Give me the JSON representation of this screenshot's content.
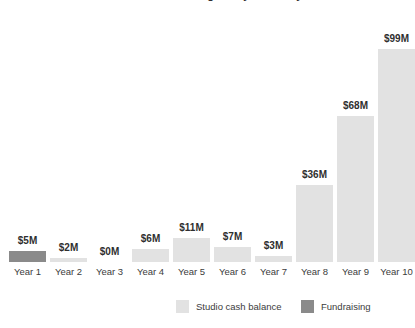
{
  "chart_data": {
    "type": "bar",
    "title": "Studio cash balance grows year over year",
    "title_clipped": true,
    "xlabel": "",
    "ylabel": "",
    "ylim": [
      0,
      108
    ],
    "grid": false,
    "legend_position": "bottom",
    "categories": [
      "Year 1",
      "Year 2",
      "Year 3",
      "Year 4",
      "Year 5",
      "Year 6",
      "Year 7",
      "Year 8",
      "Year 9",
      "Year 10"
    ],
    "values": [
      5,
      2,
      0,
      6,
      11,
      7,
      3,
      36,
      68,
      99
    ],
    "value_labels": [
      "$5M",
      "$2M",
      "$0M",
      "$6M",
      "$11M",
      "$7M",
      "$3M",
      "$36M",
      "$68M",
      "$99M"
    ],
    "bar_series": [
      "Fundraising",
      "Studio cash balance",
      "Studio cash balance",
      "Studio cash balance",
      "Studio cash balance",
      "Studio cash balance",
      "Studio cash balance",
      "Studio cash balance",
      "Studio cash balance",
      "Studio cash balance"
    ],
    "series": [
      {
        "name": "Studio cash balance",
        "color": "#e2e2e2",
        "values": [
          null,
          2,
          0,
          6,
          11,
          7,
          3,
          36,
          68,
          99
        ]
      },
      {
        "name": "Fundraising",
        "color": "#8a8a8a",
        "values": [
          5,
          null,
          null,
          null,
          null,
          null,
          null,
          null,
          null,
          null
        ]
      }
    ]
  },
  "legend": {
    "items": [
      {
        "label": "Studio cash balance",
        "color": "#e2e2e2"
      },
      {
        "label": "Fundraising",
        "color": "#8a8a8a"
      }
    ]
  },
  "colors": {
    "background": "#ffffff",
    "studio_cash_balance": "#e2e2e2",
    "fundraising": "#8a8a8a",
    "text": "#3c3c3c",
    "value_text": "#2f2f2f"
  }
}
